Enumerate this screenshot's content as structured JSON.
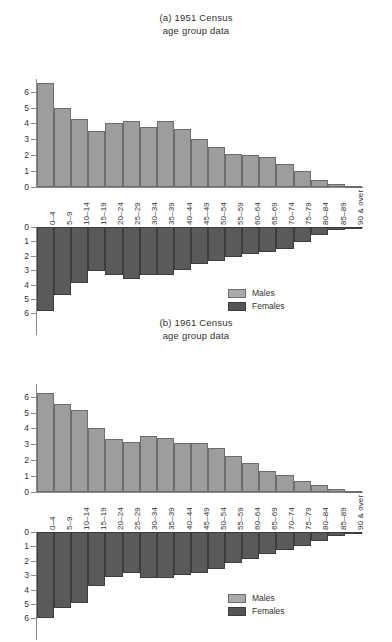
{
  "legend": {
    "males_label": "Males",
    "females_label": "Females",
    "males_color": "#9d9d9d",
    "females_color": "#5a5a5a"
  },
  "categories": [
    "0–4",
    "5–9",
    "10–14",
    "15–19",
    "20–24",
    "25–29",
    "30–34",
    "35–39",
    "40–44",
    "45–49",
    "50–54",
    "55–59",
    "60–64",
    "65–69",
    "70–74",
    "75–79",
    "80–84",
    "85–89",
    "90 & over"
  ],
  "y_ticks": [
    "0",
    "1",
    "2",
    "3",
    "4",
    "5",
    "6"
  ],
  "chart_data": [
    {
      "type": "bar",
      "id": "figure-a",
      "title": "(a) 1951 Census",
      "subtitle": "age group data",
      "xlabel": "",
      "ylabel": "",
      "ylim": [
        0,
        6.8
      ],
      "grid": false,
      "legend_position": "lower-right",
      "categories": [
        "0–4",
        "5–9",
        "10–14",
        "15–19",
        "20–24",
        "25–29",
        "30–34",
        "35–39",
        "40–44",
        "45–49",
        "50–54",
        "55–59",
        "60–64",
        "65–69",
        "70–74",
        "75–79",
        "80–84",
        "85–89",
        "90 & over"
      ],
      "series": [
        {
          "name": "Males",
          "direction": "up",
          "values": [
            6.55,
            5.0,
            4.27,
            3.52,
            4.0,
            4.15,
            3.8,
            4.15,
            3.67,
            3.0,
            2.55,
            2.1,
            2.0,
            1.87,
            1.45,
            1.0,
            0.45,
            0.17,
            0.04
          ]
        },
        {
          "name": "Females",
          "direction": "down",
          "values": [
            5.8,
            4.7,
            3.9,
            3.05,
            3.35,
            3.6,
            3.35,
            3.35,
            3.0,
            2.6,
            2.35,
            2.1,
            1.85,
            1.75,
            1.5,
            1.05,
            0.55,
            0.22,
            0.06
          ]
        }
      ]
    },
    {
      "type": "bar",
      "id": "figure-b",
      "title": "(b) 1961 Census",
      "subtitle": "age group data",
      "xlabel": "",
      "ylabel": "",
      "ylim": [
        0,
        6.8
      ],
      "grid": false,
      "legend_position": "lower-right",
      "categories": [
        "0–4",
        "5–9",
        "10–14",
        "15–19",
        "20–24",
        "25–29",
        "30–34",
        "35–39",
        "40–44",
        "45–49",
        "50–54",
        "55–59",
        "60–64",
        "65–69",
        "70–74",
        "75–79",
        "80–84",
        "85–89",
        "90 & over"
      ],
      "series": [
        {
          "name": "Males",
          "direction": "up",
          "values": [
            6.25,
            5.55,
            5.15,
            4.05,
            3.35,
            3.15,
            3.5,
            3.4,
            3.08,
            3.08,
            2.75,
            2.28,
            1.82,
            1.35,
            1.05,
            0.72,
            0.45,
            0.17,
            0.03
          ]
        },
        {
          "name": "Females",
          "direction": "down",
          "values": [
            6.0,
            5.3,
            4.9,
            3.75,
            3.1,
            2.85,
            3.2,
            3.2,
            2.95,
            2.85,
            2.55,
            2.15,
            1.85,
            1.55,
            1.25,
            0.95,
            0.6,
            0.25,
            0.05
          ]
        }
      ]
    }
  ]
}
